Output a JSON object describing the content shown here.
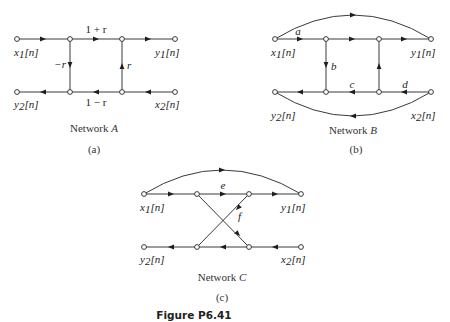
{
  "figure": {
    "caption": "Figure P6.41",
    "networks": [
      {
        "id": "A",
        "title": "Network A",
        "title_prefix": "Network ",
        "title_letter": "A",
        "sublabel": "(a)",
        "inputs": {
          "x1": "x",
          "x1_sub": "1",
          "x2": "x",
          "x2_sub": "2"
        },
        "outputs": {
          "y1": "y",
          "y1_sub": "1",
          "y2": "y",
          "y2_sub": "2"
        },
        "index": "[n]",
        "gains": {
          "top_middle": "1 + r",
          "bottom_middle": "1 − r",
          "left_vertical": "−r",
          "right_vertical": "r"
        }
      },
      {
        "id": "B",
        "title_prefix": "Network ",
        "title_letter": "B",
        "sublabel": "(b)",
        "index": "[n]",
        "gains": {
          "top_left": "a",
          "left_vertical": "b",
          "bottom_middle": "c",
          "bottom_right": "d"
        }
      },
      {
        "id": "C",
        "title_prefix": "Network ",
        "title_letter": "C",
        "sublabel": "(c)",
        "index": "[n]",
        "gains": {
          "top_middle": "e",
          "cross": "f"
        }
      }
    ],
    "signals": {
      "x": "x",
      "y": "y",
      "sub1": "1",
      "sub2": "2",
      "index": "[n]"
    }
  }
}
